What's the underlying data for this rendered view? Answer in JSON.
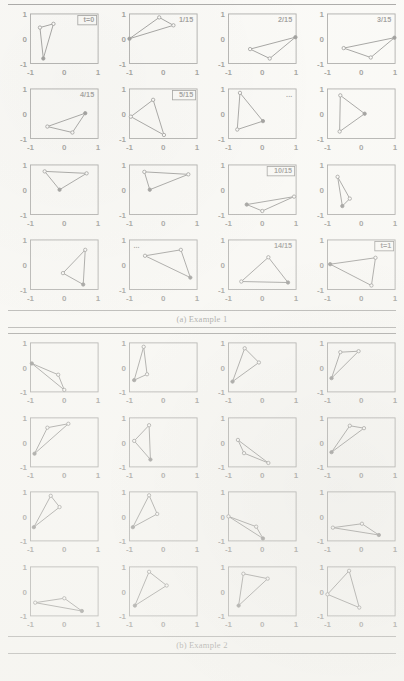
{
  "document": {
    "type": "scanned-figure-page",
    "figures": [
      "figure-a",
      "figure-b"
    ]
  },
  "axis": {
    "x_ticks": [
      "-1",
      "0",
      "1"
    ],
    "y_ticks": [
      "1",
      "0",
      "-1"
    ],
    "xlim": [
      -1,
      1
    ],
    "ylim": [
      -1,
      1
    ],
    "tick_color": "#1b1b1b",
    "frame_color": "#3b3b3b"
  },
  "figure_a": {
    "caption_number": "(a)",
    "caption_text": "Example 1",
    "caption_full": "(a) Example 1",
    "rows": 4,
    "cols": 4
  },
  "figure_b": {
    "caption_number": "(b)",
    "caption_text": "Example 2",
    "caption_full": "(b) Example 2",
    "rows": 4,
    "cols": 4
  },
  "chart_data": [
    {
      "id": "figure-a",
      "type": "scatter",
      "title": "(a) Example 1",
      "xlabel": "",
      "ylabel": "",
      "xlim": [
        -1,
        1
      ],
      "ylim": [
        -1,
        1
      ],
      "grid": false,
      "legend": "none",
      "marker_style": "filled and open circles, connected as closed triangle",
      "panels": [
        {
          "index": 0,
          "label": "t=0",
          "label_boxed": true,
          "label_pos": "top-right",
          "vertices": [
            [
              -0.62,
              -0.8
            ],
            [
              -0.72,
              0.45
            ],
            [
              -0.32,
              0.6
            ]
          ],
          "filled": [
            true,
            false,
            false
          ]
        },
        {
          "index": 1,
          "label": "1/15",
          "label_boxed": false,
          "label_pos": "top-right",
          "vertices": [
            [
              -1.0,
              0.0
            ],
            [
              -0.12,
              0.86
            ],
            [
              0.3,
              0.54
            ]
          ],
          "filled": [
            true,
            false,
            false
          ]
        },
        {
          "index": 2,
          "label": "2/15",
          "label_boxed": false,
          "label_pos": "top-right",
          "vertices": [
            [
              -0.36,
              -0.42
            ],
            [
              0.98,
              0.06
            ],
            [
              0.22,
              -0.8
            ]
          ],
          "filled": [
            false,
            true,
            false
          ]
        },
        {
          "index": 3,
          "label": "3/15",
          "label_boxed": false,
          "label_pos": "top-right",
          "vertices": [
            [
              -0.52,
              -0.38
            ],
            [
              0.98,
              0.04
            ],
            [
              0.28,
              -0.76
            ]
          ],
          "filled": [
            false,
            true,
            false
          ]
        },
        {
          "index": 4,
          "label": "4/15",
          "label_boxed": false,
          "label_pos": "top-right",
          "vertices": [
            [
              -0.5,
              -0.52
            ],
            [
              0.62,
              0.02
            ],
            [
              0.24,
              -0.76
            ]
          ],
          "filled": [
            false,
            true,
            false
          ]
        },
        {
          "index": 5,
          "label": "5/15",
          "label_boxed": true,
          "label_pos": "top-right",
          "vertices": [
            [
              -0.96,
              -0.12
            ],
            [
              -0.3,
              0.56
            ],
            [
              0.02,
              -0.86
            ]
          ],
          "filled": [
            false,
            false,
            false
          ]
        },
        {
          "index": 6,
          "label": "...",
          "label_boxed": false,
          "label_pos": "top-right",
          "vertices": [
            [
              -0.66,
              0.84
            ],
            [
              -0.74,
              -0.64
            ],
            [
              0.02,
              -0.3
            ]
          ],
          "filled": [
            false,
            false,
            true
          ]
        },
        {
          "index": 7,
          "label": "",
          "label_boxed": false,
          "label_pos": "top-right",
          "vertices": [
            [
              -0.62,
              0.74
            ],
            [
              -0.64,
              -0.72
            ],
            [
              0.1,
              0.0
            ]
          ],
          "filled": [
            false,
            false,
            true
          ]
        },
        {
          "index": 8,
          "label": "",
          "label_boxed": false,
          "label_pos": "top-right",
          "vertices": [
            [
              -0.58,
              0.74
            ],
            [
              0.66,
              0.66
            ],
            [
              -0.14,
              0.0
            ]
          ],
          "filled": [
            false,
            false,
            true
          ]
        },
        {
          "index": 9,
          "label": "",
          "label_boxed": false,
          "label_pos": "top-right",
          "vertices": [
            [
              -0.56,
              0.72
            ],
            [
              0.74,
              0.62
            ],
            [
              -0.4,
              0.0
            ]
          ],
          "filled": [
            false,
            false,
            true
          ]
        },
        {
          "index": 10,
          "label": "10/15",
          "label_boxed": true,
          "label_pos": "top-right",
          "vertices": [
            [
              -0.46,
              -0.6
            ],
            [
              0.94,
              -0.28
            ],
            [
              0.0,
              -0.86
            ]
          ],
          "filled": [
            true,
            false,
            false
          ]
        },
        {
          "index": 11,
          "label": "",
          "label_boxed": false,
          "label_pos": "top-right",
          "vertices": [
            [
              -0.7,
              0.52
            ],
            [
              -0.56,
              -0.66
            ],
            [
              -0.34,
              -0.36
            ]
          ],
          "filled": [
            false,
            true,
            false
          ]
        },
        {
          "index": 12,
          "label": "",
          "label_boxed": false,
          "label_pos": "top-right",
          "vertices": [
            [
              -0.04,
              -0.34
            ],
            [
              0.62,
              0.6
            ],
            [
              0.56,
              -0.8
            ]
          ],
          "filled": [
            false,
            false,
            true
          ]
        },
        {
          "index": 13,
          "label": "...",
          "label_boxed": false,
          "label_pos": "top-left",
          "vertices": [
            [
              -0.54,
              0.36
            ],
            [
              0.52,
              0.6
            ],
            [
              0.8,
              -0.52
            ]
          ],
          "filled": [
            false,
            false,
            true
          ]
        },
        {
          "index": 14,
          "label": "14/15",
          "label_boxed": false,
          "label_pos": "top-right",
          "vertices": [
            [
              -0.62,
              -0.68
            ],
            [
              0.18,
              0.3
            ],
            [
              0.76,
              -0.72
            ]
          ],
          "filled": [
            false,
            false,
            true
          ]
        },
        {
          "index": 15,
          "label": "t=1",
          "label_boxed": true,
          "label_pos": "top-right",
          "vertices": [
            [
              -0.92,
              0.02
            ],
            [
              0.42,
              0.28
            ],
            [
              0.3,
              -0.84
            ]
          ],
          "filled": [
            true,
            false,
            false
          ]
        }
      ]
    },
    {
      "id": "figure-b",
      "type": "scatter",
      "title": "(b) Example 2",
      "xlabel": "",
      "ylabel": "",
      "xlim": [
        -1,
        1
      ],
      "ylim": [
        -1,
        1
      ],
      "grid": false,
      "legend": "none",
      "marker_style": "filled and open circles, connected as closed triangle",
      "panels": [
        {
          "index": 0,
          "label": "",
          "label_boxed": false,
          "label_pos": "top-right",
          "vertices": [
            [
              -0.96,
              0.16
            ],
            [
              -0.18,
              -0.3
            ],
            [
              0.0,
              -0.92
            ]
          ],
          "filled": [
            true,
            false,
            false
          ]
        },
        {
          "index": 1,
          "label": "",
          "label_boxed": false,
          "label_pos": "top-right",
          "vertices": [
            [
              -0.58,
              0.84
            ],
            [
              -0.86,
              -0.52
            ],
            [
              -0.48,
              -0.28
            ]
          ],
          "filled": [
            false,
            true,
            false
          ]
        },
        {
          "index": 2,
          "label": "",
          "label_boxed": false,
          "label_pos": "top-right",
          "vertices": [
            [
              -0.52,
              0.78
            ],
            [
              -0.88,
              -0.58
            ],
            [
              -0.1,
              0.2
            ]
          ],
          "filled": [
            false,
            true,
            false
          ]
        },
        {
          "index": 3,
          "label": "",
          "label_boxed": false,
          "label_pos": "top-right",
          "vertices": [
            [
              -0.62,
              0.62
            ],
            [
              -0.88,
              -0.44
            ],
            [
              -0.08,
              0.66
            ]
          ],
          "filled": [
            false,
            true,
            false
          ]
        },
        {
          "index": 4,
          "label": "",
          "label_boxed": false,
          "label_pos": "top-right",
          "vertices": [
            [
              -0.88,
              -0.46
            ],
            [
              -0.5,
              0.6
            ],
            [
              0.12,
              0.76
            ]
          ],
          "filled": [
            true,
            false,
            false
          ]
        },
        {
          "index": 5,
          "label": "",
          "label_boxed": false,
          "label_pos": "top-right",
          "vertices": [
            [
              -0.42,
              0.7
            ],
            [
              -0.86,
              0.06
            ],
            [
              -0.38,
              -0.7
            ]
          ],
          "filled": [
            false,
            false,
            true
          ]
        },
        {
          "index": 6,
          "label": "",
          "label_boxed": false,
          "label_pos": "top-right",
          "vertices": [
            [
              -0.72,
              0.1
            ],
            [
              -0.54,
              -0.44
            ],
            [
              0.18,
              -0.84
            ]
          ],
          "filled": [
            false,
            false,
            false
          ]
        },
        {
          "index": 7,
          "label": "",
          "label_boxed": false,
          "label_pos": "top-right",
          "vertices": [
            [
              -0.88,
              -0.4
            ],
            [
              -0.34,
              0.68
            ],
            [
              0.08,
              0.58
            ]
          ],
          "filled": [
            true,
            false,
            false
          ]
        },
        {
          "index": 8,
          "label": "",
          "label_boxed": false,
          "label_pos": "top-right",
          "vertices": [
            [
              -0.9,
              -0.44
            ],
            [
              -0.4,
              0.84
            ],
            [
              -0.14,
              0.38
            ]
          ],
          "filled": [
            true,
            false,
            false
          ]
        },
        {
          "index": 9,
          "label": "",
          "label_boxed": false,
          "label_pos": "top-right",
          "vertices": [
            [
              -0.9,
              -0.44
            ],
            [
              -0.42,
              0.86
            ],
            [
              -0.18,
              0.1
            ]
          ],
          "filled": [
            true,
            false,
            false
          ]
        },
        {
          "index": 10,
          "label": "",
          "label_boxed": false,
          "label_pos": "top-right",
          "vertices": [
            [
              -1.0,
              0.0
            ],
            [
              -0.18,
              -0.42
            ],
            [
              0.02,
              -0.9
            ]
          ],
          "filled": [
            false,
            false,
            true
          ]
        },
        {
          "index": 11,
          "label": "",
          "label_boxed": false,
          "label_pos": "top-right",
          "vertices": [
            [
              -0.84,
              -0.46
            ],
            [
              0.02,
              -0.3
            ],
            [
              0.52,
              -0.76
            ]
          ],
          "filled": [
            false,
            false,
            true
          ]
        },
        {
          "index": 12,
          "label": "",
          "label_boxed": false,
          "label_pos": "top-right",
          "vertices": [
            [
              -0.86,
              -0.46
            ],
            [
              0.0,
              -0.28
            ],
            [
              0.52,
              -0.8
            ]
          ],
          "filled": [
            false,
            false,
            true
          ]
        },
        {
          "index": 13,
          "label": "",
          "label_boxed": false,
          "label_pos": "top-right",
          "vertices": [
            [
              -0.84,
              -0.58
            ],
            [
              -0.42,
              0.8
            ],
            [
              0.1,
              0.24
            ]
          ],
          "filled": [
            true,
            false,
            false
          ]
        },
        {
          "index": 14,
          "label": "",
          "label_boxed": false,
          "label_pos": "top-right",
          "vertices": [
            [
              -0.7,
              -0.58
            ],
            [
              -0.56,
              0.72
            ],
            [
              0.16,
              0.52
            ]
          ],
          "filled": [
            true,
            false,
            false
          ]
        },
        {
          "index": 15,
          "label": "",
          "label_boxed": false,
          "label_pos": "top-right",
          "vertices": [
            [
              -1.0,
              -0.12
            ],
            [
              -0.36,
              0.84
            ],
            [
              -0.06,
              -0.66
            ]
          ],
          "filled": [
            false,
            false,
            false
          ]
        }
      ]
    }
  ]
}
